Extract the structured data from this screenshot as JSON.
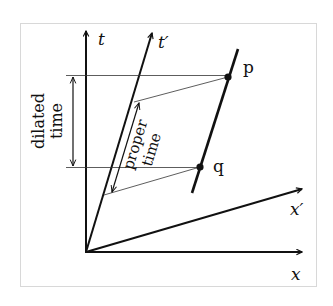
{
  "diagram": {
    "type": "spacetime-diagram",
    "colors": {
      "background": "#ffffff",
      "frame": "#d8d8d8",
      "ink": "#111111",
      "thin_line": "#333333"
    },
    "axes": {
      "t": "t",
      "t_prime": "t′",
      "x": "x",
      "x_prime": "x′"
    },
    "events": {
      "p": "p",
      "q": "q"
    },
    "annotations": {
      "dilated_line1": "dilated",
      "dilated_line2": "time",
      "proper_line1": "proper",
      "proper_line2": "time"
    }
  }
}
